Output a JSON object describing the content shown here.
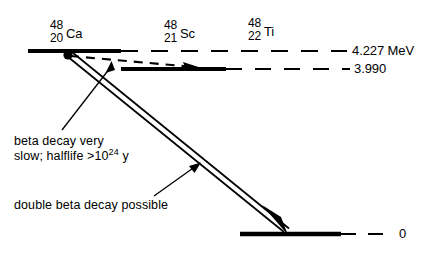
{
  "diagram": {
    "nuclides": [
      {
        "mass": "48",
        "atomic": "20",
        "symbol": "Ca"
      },
      {
        "mass": "48",
        "atomic": "21",
        "symbol": "Sc"
      },
      {
        "mass": "48",
        "atomic": "22",
        "symbol": "Ti"
      }
    ],
    "levels": [
      {
        "name": "ca48-level",
        "energy_label": "4.227 MeV",
        "value": 4.227,
        "unit": "MeV"
      },
      {
        "name": "sc48-level",
        "energy_label": "3.990",
        "value": 3.99,
        "unit": "MeV"
      },
      {
        "name": "ti48-level",
        "energy_label": "0",
        "value": 0,
        "unit": "MeV"
      }
    ],
    "annotations": [
      {
        "name": "beta-decay-note",
        "line1": "beta decay very",
        "line2_pre": "slow; halflife >",
        "line2_base": "10",
        "line2_exp": "24",
        "line2_post": "y"
      },
      {
        "name": "double-beta-note",
        "text": "double beta decay possible"
      }
    ],
    "colors": {
      "ink": "#000000",
      "background": "#ffffff"
    }
  }
}
